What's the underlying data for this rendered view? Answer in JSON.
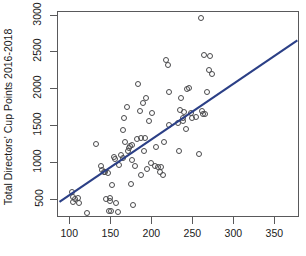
{
  "chart_data": {
    "type": "scatter",
    "title": "",
    "xlabel": "",
    "ylabel": "Total Directors' Cup Points 2016-2018",
    "xlim": [
      85,
      380
    ],
    "ylim": [
      250,
      3050
    ],
    "xticks": [
      100,
      150,
      200,
      250,
      300,
      350
    ],
    "yticks": [
      500,
      1000,
      1500,
      2000,
      2500,
      3000
    ],
    "grid": false,
    "legend": "none",
    "marker": "open-circle",
    "marker_color": "#4a4a4c",
    "line_color": "#2b3f86",
    "fit_line": {
      "type": "linear-regression",
      "x_start": 88,
      "y_start": 455,
      "x_end": 378,
      "y_end": 2650
    },
    "x": [
      103,
      104,
      105,
      107,
      110,
      112,
      121,
      133,
      139,
      140,
      142,
      143,
      145,
      147,
      148,
      149,
      150,
      151,
      152,
      154,
      156,
      157,
      159,
      161,
      163,
      165,
      166,
      167,
      168,
      170,
      172,
      173,
      174,
      175,
      176,
      177,
      178,
      180,
      182,
      184,
      186,
      187,
      188,
      190,
      191,
      192,
      193,
      195,
      197,
      199,
      201,
      204,
      206,
      208,
      210,
      212,
      214,
      216,
      218,
      220,
      221,
      222,
      232,
      234,
      235,
      236,
      238,
      239,
      240,
      242,
      244,
      246,
      248,
      250,
      255,
      258,
      260,
      262,
      263,
      264,
      265,
      268,
      270,
      272,
      274,
      276,
      278,
      294,
      295,
      296,
      297,
      311,
      314,
      348,
      367
    ],
    "y": [
      590,
      460,
      525,
      490,
      515,
      440,
      305,
      1240,
      945,
      885,
      860,
      855,
      490,
      850,
      335,
      465,
      505,
      335,
      690,
      1060,
      1040,
      440,
      315,
      960,
      1095,
      1055,
      1430,
      1590,
      1270,
      1740,
      1150,
      1190,
      1215,
      700,
      1020,
      1230,
      415,
      950,
      1310,
      2060,
      1690,
      820,
      1330,
      1805,
      1150,
      1330,
      1870,
      900,
      1550,
      985,
      1670,
      940,
      1205,
      930,
      865,
      930,
      815,
      1265,
      2390,
      2320,
      1950,
      1495,
      1530,
      1150,
      1700,
      1870,
      1590,
      1555,
      1675,
      1450,
      1995,
      2010,
      1660,
      1590,
      1605,
      1110,
      2950,
      1695,
      1650,
      2455,
      1645,
      1945,
      2245,
      2440,
      2195
    ],
    "n_points": 95
  }
}
